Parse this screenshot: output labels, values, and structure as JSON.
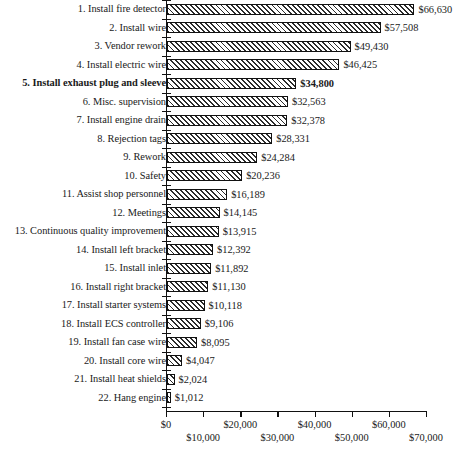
{
  "chart_data": {
    "type": "bar",
    "orientation": "horizontal",
    "title": "",
    "xlabel": "",
    "ylabel": "",
    "xlim": [
      0,
      70000
    ],
    "grid": false,
    "legend": null,
    "currency_prefix": "$",
    "categories": [
      "1. Install fire detector",
      "2. Install wire",
      "3. Vendor rework",
      "4. Install electric wire",
      "5. Install exhaust plug and sleeve",
      "6. Misc. supervision",
      "7. Install engine drain",
      "8. Rejection tags",
      "9. Rework",
      "10. Safety",
      "11. Assist shop personnel",
      "12. Meetings",
      "13. Continuous quality improvement",
      "14. Install left bracket",
      "15. Install inlet",
      "16. Install right bracket",
      "17. Install starter systems",
      "18. Install ECS controller",
      "19. Install fan case wire",
      "20. Install core wire",
      "21. Install heat shields",
      "22. Hang engine"
    ],
    "values": [
      66630,
      57508,
      49430,
      46425,
      34800,
      32563,
      32378,
      28331,
      24284,
      20236,
      16189,
      14145,
      13915,
      12392,
      11892,
      11130,
      10118,
      9106,
      8095,
      4047,
      2024,
      1012
    ],
    "value_labels": [
      "$66,630",
      "$57,508",
      "$49,430",
      "$46,425",
      "$34,800",
      "$32,563",
      "$32,378",
      "$28,331",
      "$24,284",
      "$20,236",
      "$16,189",
      "$14,145",
      "$13,915",
      "$12,392",
      "$11,892",
      "$11,130",
      "$10,118",
      "$9,106",
      "$8,095",
      "$4,047",
      "$2,024",
      "$1,012"
    ],
    "highlighted_index": 4,
    "xticks": [
      0,
      10000,
      20000,
      30000,
      40000,
      50000,
      60000,
      70000
    ],
    "xtick_labels": [
      "$0",
      "$10,000",
      "$20,000",
      "$30,000",
      "$40,000",
      "$50,000",
      "$60,000",
      "$70,000"
    ]
  },
  "caption": {
    "text": ""
  }
}
